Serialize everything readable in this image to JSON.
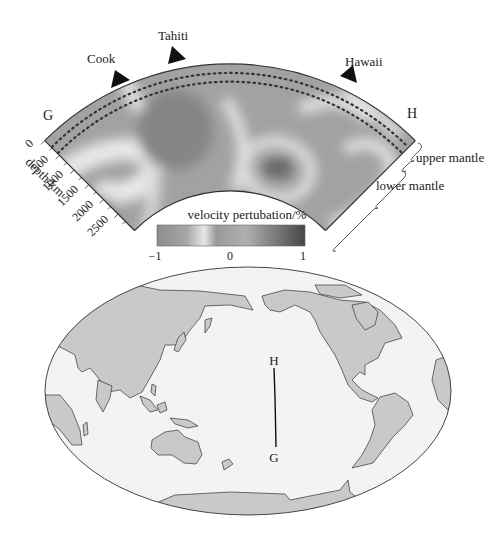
{
  "figure": {
    "cross_section": {
      "stations": [
        {
          "name": "Cook",
          "label": "Cook"
        },
        {
          "name": "Tahiti",
          "label": "Tahiti"
        },
        {
          "name": "Hawaii",
          "label": "Hawaii"
        }
      ],
      "endpoint_left": "G",
      "endpoint_right": "H",
      "depth_axis": {
        "label": "depth/km",
        "ticks": [
          "0",
          "500",
          "1000",
          "1500",
          "2000",
          "2500"
        ]
      },
      "layer_labels": {
        "upper": "upper mantle",
        "lower": "lower mantle"
      }
    },
    "colorbar": {
      "title": "velocity pertubation/%",
      "tick_min": "−1",
      "tick_mid": "0",
      "tick_max": "1",
      "colors": [
        "#8d8d8d",
        "#a9a9a9",
        "#e4e4e4",
        "#9a9a9a",
        "#b3b3b3",
        "#7a7a7a",
        "#4a4a4a"
      ]
    },
    "map": {
      "profile_start": "H",
      "profile_end": "G",
      "land_color": "#c9c9c9",
      "ocean_color": "#f3f3f3"
    }
  }
}
